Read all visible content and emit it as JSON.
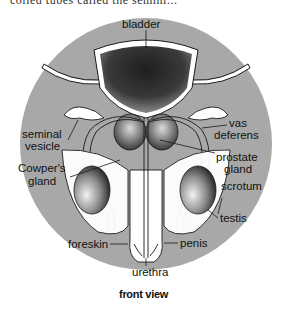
{
  "header": {
    "cut_off_text": "coiled tubes called the semini..."
  },
  "diagram": {
    "title_caption": "front view",
    "colors": {
      "background_disc": "#a8a8a8",
      "organ_fill": "#ffffff",
      "outline": "#1a1a1a",
      "shading": "#2a2a2a"
    },
    "labels": {
      "bladder": "bladder",
      "seminal_vesicle_1": "seminal",
      "seminal_vesicle_2": "vesicle",
      "cowpers_gland_1": "Cowper's",
      "cowpers_gland_2": "gland",
      "vas_deferens_1": "vas",
      "vas_deferens_2": "deferens",
      "prostate_gland_1": "prostate",
      "prostate_gland_2": "gland",
      "scrotum": "scrotum",
      "testis": "testis",
      "foreskin": "foreskin",
      "penis": "penis",
      "urethra": "urethra"
    }
  }
}
